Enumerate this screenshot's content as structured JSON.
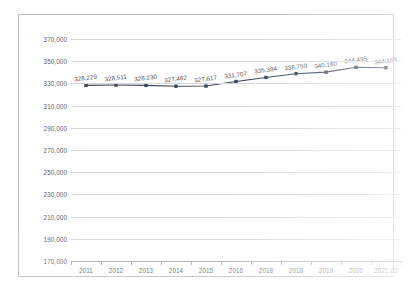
{
  "chart_data": {
    "type": "line",
    "title": "",
    "xlabel": "",
    "ylabel": "",
    "ylim": [
      170000,
      370000
    ],
    "ytick_step": 20000,
    "grid": true,
    "legend": "none",
    "line_color": "#3b4756",
    "marker": "square",
    "categories": [
      "2011",
      "2012",
      "2013",
      "2014",
      "2015",
      "2016",
      "2018",
      "2018",
      "2019",
      "2020",
      "2021.03"
    ],
    "values": [
      328229,
      328511,
      328230,
      327462,
      327617,
      331707,
      335384,
      338759,
      340160,
      344495,
      344153
    ],
    "point_labels": [
      "328,229",
      "328,511",
      "328,230",
      "327,462",
      "327,617",
      "331,707",
      "335,384",
      "338,759",
      "340,160",
      "344,495",
      "344,153"
    ],
    "ytick_labels": [
      "370,000",
      "350,000",
      "330,000",
      "310,000",
      "290,000",
      "270,000",
      "250,000",
      "230,000",
      "210,000",
      "190,000",
      "170,000"
    ],
    "ytick_values": [
      370000,
      350000,
      330000,
      310000,
      290000,
      270000,
      250000,
      230000,
      210000,
      190000,
      170000
    ]
  },
  "colors": {
    "series": "#3b4756",
    "grid": "#d6d8da",
    "axis": "#a8abaf",
    "frame": "#b9bcc0",
    "text": "#5d6268"
  }
}
